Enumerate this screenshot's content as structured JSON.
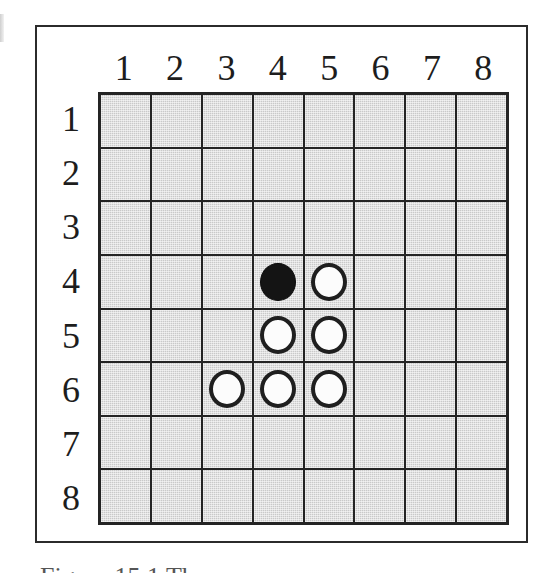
{
  "figure": {
    "kind": "othello-board-diagram",
    "caption_clipped_text": "Figure 15.1  The",
    "board": {
      "size": 8,
      "column_headers": [
        "1",
        "2",
        "3",
        "4",
        "5",
        "6",
        "7",
        "8"
      ],
      "row_headers": [
        "1",
        "2",
        "3",
        "4",
        "5",
        "6",
        "7",
        "8"
      ],
      "cell_color": "#c9c9c9",
      "gridline_color": "#242424",
      "black_disc_color": "#141414",
      "white_disc_color": "#fcfcfc",
      "white_disc_outline_color": "#1f1f1f",
      "frame_color": "#2b2b2b",
      "background_color": "#ffffff"
    }
  },
  "chart_data": {
    "type": "heatmap",
    "xlabel": "column",
    "ylabel": "row",
    "categories": [
      "1",
      "2",
      "3",
      "4",
      "5",
      "6",
      "7",
      "8"
    ],
    "row_categories": [
      "1",
      "2",
      "3",
      "4",
      "5",
      "6",
      "7",
      "8"
    ],
    "legend": [
      "black disc",
      "white disc",
      "empty square"
    ],
    "grid": [
      [
        "",
        "",
        "",
        "",
        "",
        "",
        "",
        ""
      ],
      [
        "",
        "",
        "",
        "",
        "",
        "",
        "",
        ""
      ],
      [
        "",
        "",
        "",
        "",
        "",
        "",
        "",
        ""
      ],
      [
        "",
        "",
        "",
        "black",
        "white",
        "",
        "",
        ""
      ],
      [
        "",
        "",
        "",
        "white",
        "white",
        "",
        "",
        ""
      ],
      [
        "",
        "",
        "white",
        "white",
        "white",
        "",
        "",
        ""
      ],
      [
        "",
        "",
        "",
        "",
        "",
        "",
        "",
        ""
      ],
      [
        "",
        "",
        "",
        "",
        "",
        "",
        "",
        ""
      ]
    ],
    "pieces": [
      {
        "column": 4,
        "row": 4,
        "color": "black"
      },
      {
        "column": 5,
        "row": 4,
        "color": "white"
      },
      {
        "column": 4,
        "row": 5,
        "color": "white"
      },
      {
        "column": 5,
        "row": 5,
        "color": "white"
      },
      {
        "column": 3,
        "row": 6,
        "color": "white"
      },
      {
        "column": 4,
        "row": 6,
        "color": "white"
      },
      {
        "column": 5,
        "row": 6,
        "color": "white"
      }
    ],
    "counts": {
      "black": 1,
      "white": 6,
      "empty": 57
    }
  }
}
